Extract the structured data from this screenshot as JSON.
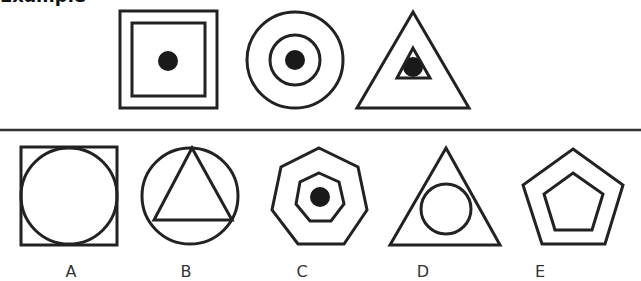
{
  "header": {
    "title": "Example"
  },
  "colors": {
    "stroke": "#222222",
    "fill_dot": "#1a1a1a",
    "divider": "#333333",
    "label": "#333333"
  },
  "example_row": {
    "figures": [
      {
        "id": "example-1",
        "description": "square inside square with central dot"
      },
      {
        "id": "example-2",
        "description": "circle inside circle with central dot"
      },
      {
        "id": "example-3",
        "description": "triangle inside triangle with central dot"
      }
    ]
  },
  "options": [
    {
      "label": "A",
      "description": "circle inscribed in square"
    },
    {
      "label": "B",
      "description": "triangle inscribed in circle"
    },
    {
      "label": "C",
      "description": "heptagon inside heptagon with central dot"
    },
    {
      "label": "D",
      "description": "circle inside triangle"
    },
    {
      "label": "E",
      "description": "pentagon inside pentagon"
    }
  ]
}
